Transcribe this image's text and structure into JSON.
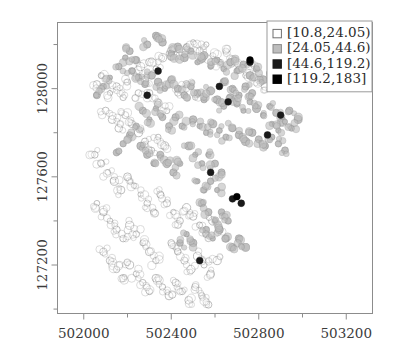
{
  "chart_data": {
    "type": "scatter",
    "title": "",
    "subtitle": "",
    "xlabel": "",
    "ylabel": "",
    "xlim": [
      501880,
      503320
    ],
    "ylim": [
      126980,
      128300
    ],
    "xticks": [
      502000,
      502400,
      502800,
      503200
    ],
    "xtick_labels": [
      "502000",
      "502400",
      "502800",
      "503200"
    ],
    "yticks": [
      127200,
      127600,
      128000
    ],
    "ytick_labels": [
      "127200",
      "127600",
      "128000"
    ],
    "minor_x_ticks": [
      502200,
      502600,
      503000
    ],
    "minor_y_ticks": [
      127000,
      127400,
      127800,
      128200
    ],
    "grid": false,
    "legend_position": "top-right",
    "legend_title": "",
    "classes": [
      {
        "label": "[10.8,24.05)",
        "fill": "#ffffff",
        "stroke": "#6f6f6f",
        "swatch": "open-square"
      },
      {
        "label": "[24.05,44.6)",
        "fill": "#bdbdbd",
        "stroke": "#8a8a8a",
        "swatch": "filled-square"
      },
      {
        "label": "[44.6,119.2)",
        "fill": "#1a1a1a",
        "stroke": "#1a1a1a",
        "swatch": "filled-square"
      },
      {
        "label": "[119.2,183]",
        "fill": "#000000",
        "stroke": "#000000",
        "swatch": "filled-square"
      }
    ],
    "series": [
      {
        "name": "[10.8,24.05)",
        "class_index": 0,
        "marker": "circle",
        "points": [
          [
            502120,
            127980
          ],
          [
            502150,
            128010
          ],
          [
            502180,
            127960
          ],
          [
            502200,
            128030
          ],
          [
            502240,
            128070
          ],
          [
            502260,
            128100
          ],
          [
            502300,
            128120
          ],
          [
            502330,
            128090
          ],
          [
            502360,
            128140
          ],
          [
            502390,
            128160
          ],
          [
            502410,
            128180
          ],
          [
            502440,
            128150
          ],
          [
            502470,
            128190
          ],
          [
            502500,
            128210
          ],
          [
            502530,
            128170
          ],
          [
            502560,
            128200
          ],
          [
            502590,
            128150
          ],
          [
            502620,
            128120
          ],
          [
            502650,
            128170
          ],
          [
            502680,
            128130
          ],
          [
            502710,
            128090
          ],
          [
            502740,
            128060
          ],
          [
            502770,
            128110
          ],
          [
            502800,
            128040
          ],
          [
            502830,
            128010
          ],
          [
            502100,
            127900
          ],
          [
            502130,
            127860
          ],
          [
            502160,
            127820
          ],
          [
            502190,
            127880
          ],
          [
            502220,
            127840
          ],
          [
            502250,
            127800
          ],
          [
            502280,
            127760
          ],
          [
            502310,
            127720
          ],
          [
            502340,
            127780
          ],
          [
            502370,
            127740
          ],
          [
            502050,
            127700
          ],
          [
            502080,
            127660
          ],
          [
            502110,
            127620
          ],
          [
            502140,
            127580
          ],
          [
            502170,
            127540
          ],
          [
            502200,
            127600
          ],
          [
            502230,
            127560
          ],
          [
            502260,
            127520
          ],
          [
            502290,
            127480
          ],
          [
            502320,
            127440
          ],
          [
            502060,
            127480
          ],
          [
            502090,
            127440
          ],
          [
            502120,
            127400
          ],
          [
            502150,
            127360
          ],
          [
            502180,
            127320
          ],
          [
            502210,
            127380
          ],
          [
            502240,
            127340
          ],
          [
            502270,
            127300
          ],
          [
            502300,
            127260
          ],
          [
            502330,
            127220
          ],
          [
            502090,
            127260
          ],
          [
            502120,
            127220
          ],
          [
            502150,
            127180
          ],
          [
            502180,
            127140
          ],
          [
            502210,
            127200
          ],
          [
            502240,
            127160
          ],
          [
            502270,
            127120
          ],
          [
            502300,
            127080
          ],
          [
            502330,
            127140
          ],
          [
            502360,
            127100
          ],
          [
            502390,
            127060
          ],
          [
            502420,
            127120
          ],
          [
            502450,
            127080
          ],
          [
            502480,
            127040
          ],
          [
            502510,
            127100
          ],
          [
            502540,
            127060
          ],
          [
            502570,
            127020
          ],
          [
            502400,
            127300
          ],
          [
            502430,
            127260
          ],
          [
            502460,
            127220
          ],
          [
            502490,
            127180
          ],
          [
            502520,
            127240
          ],
          [
            502550,
            127200
          ],
          [
            502580,
            127160
          ],
          [
            502610,
            127220
          ],
          [
            502350,
            127520
          ],
          [
            502380,
            127480
          ],
          [
            502410,
            127440
          ],
          [
            502440,
            127400
          ],
          [
            502470,
            127460
          ],
          [
            502500,
            127420
          ],
          [
            502530,
            127380
          ],
          [
            502560,
            127340
          ],
          [
            502590,
            127400
          ],
          [
            502620,
            127360
          ],
          [
            502060,
            128020
          ],
          [
            502080,
            128060
          ],
          [
            502300,
            127980
          ],
          [
            502340,
            127940
          ],
          [
            502380,
            127900
          ],
          [
            502430,
            127980
          ],
          [
            502470,
            128020
          ],
          [
            502510,
            127960
          ],
          [
            502250,
            127980
          ],
          [
            502280,
            128040
          ]
        ]
      },
      {
        "name": "[24.05,44.6)",
        "class_index": 1,
        "marker": "circle",
        "points": [
          [
            502290,
            128200
          ],
          [
            502330,
            128240
          ],
          [
            502360,
            128210
          ],
          [
            502400,
            128160
          ],
          [
            502430,
            128190
          ],
          [
            502460,
            128140
          ],
          [
            502490,
            128170
          ],
          [
            502520,
            128120
          ],
          [
            502550,
            128150
          ],
          [
            502580,
            128100
          ],
          [
            502610,
            128130
          ],
          [
            502640,
            128090
          ],
          [
            502670,
            128120
          ],
          [
            502700,
            128080
          ],
          [
            502730,
            128110
          ],
          [
            502760,
            128060
          ],
          [
            502790,
            128090
          ],
          [
            502820,
            128040
          ],
          [
            502850,
            128070
          ],
          [
            502880,
            128020
          ],
          [
            502220,
            128080
          ],
          [
            502250,
            128050
          ],
          [
            502280,
            128020
          ],
          [
            502310,
            128060
          ],
          [
            502340,
            128030
          ],
          [
            502370,
            128000
          ],
          [
            502400,
            128040
          ],
          [
            502430,
            128000
          ],
          [
            502460,
            127970
          ],
          [
            502490,
            128010
          ],
          [
            502520,
            127980
          ],
          [
            502550,
            127950
          ],
          [
            502580,
            127990
          ],
          [
            502610,
            127950
          ],
          [
            502640,
            127920
          ],
          [
            502670,
            127960
          ],
          [
            502700,
            127930
          ],
          [
            502730,
            127900
          ],
          [
            502760,
            127940
          ],
          [
            502790,
            127910
          ],
          [
            502820,
            127880
          ],
          [
            502850,
            127920
          ],
          [
            502880,
            127890
          ],
          [
            502910,
            127860
          ],
          [
            502940,
            127900
          ],
          [
            502500,
            127860
          ],
          [
            502530,
            127830
          ],
          [
            502560,
            127800
          ],
          [
            502590,
            127840
          ],
          [
            502620,
            127810
          ],
          [
            502650,
            127780
          ],
          [
            502680,
            127820
          ],
          [
            502710,
            127790
          ],
          [
            502740,
            127760
          ],
          [
            502770,
            127800
          ],
          [
            502800,
            127770
          ],
          [
            502830,
            127740
          ],
          [
            502860,
            127780
          ],
          [
            502890,
            127750
          ],
          [
            502920,
            127720
          ],
          [
            502480,
            127740
          ],
          [
            502510,
            127700
          ],
          [
            502540,
            127660
          ],
          [
            502570,
            127700
          ],
          [
            502600,
            127660
          ],
          [
            502630,
            127620
          ],
          [
            502520,
            127580
          ],
          [
            502550,
            127540
          ],
          [
            502580,
            127580
          ],
          [
            502610,
            127540
          ],
          [
            502540,
            127480
          ],
          [
            502570,
            127440
          ],
          [
            502600,
            127400
          ],
          [
            502630,
            127440
          ],
          [
            502660,
            127400
          ],
          [
            502560,
            127360
          ],
          [
            502590,
            127320
          ],
          [
            502620,
            127360
          ],
          [
            502650,
            127320
          ],
          [
            502680,
            127280
          ],
          [
            502710,
            127320
          ],
          [
            502740,
            127280
          ],
          [
            502500,
            127300
          ],
          [
            502470,
            127340
          ],
          [
            502440,
            127300
          ],
          [
            502190,
            128140
          ],
          [
            502160,
            128100
          ],
          [
            502210,
            128170
          ],
          [
            502240,
            128130
          ],
          [
            502120,
            128050
          ],
          [
            502090,
            128010
          ],
          [
            502060,
            127970
          ],
          [
            502270,
            127900
          ],
          [
            502300,
            127860
          ],
          [
            502330,
            127910
          ],
          [
            502360,
            127870
          ],
          [
            502390,
            127830
          ],
          [
            502420,
            127870
          ],
          [
            502450,
            127830
          ],
          [
            502240,
            127830
          ],
          [
            502210,
            127790
          ],
          [
            502180,
            127750
          ],
          [
            502150,
            127710
          ],
          [
            502260,
            127740
          ],
          [
            502290,
            127700
          ],
          [
            502320,
            127660
          ],
          [
            502350,
            127700
          ],
          [
            502380,
            127660
          ],
          [
            502410,
            127620
          ],
          [
            502440,
            127660
          ],
          [
            502680,
            128000
          ],
          [
            502710,
            127970
          ],
          [
            502740,
            128010
          ],
          [
            502770,
            127980
          ],
          [
            502640,
            128030
          ],
          [
            502860,
            127840
          ],
          [
            502890,
            127810
          ],
          [
            502920,
            127850
          ],
          [
            502950,
            127820
          ],
          [
            502980,
            127860
          ]
        ]
      },
      {
        "name": "[44.6,119.2)",
        "class_index": 2,
        "marker": "circle",
        "points": [
          [
            502340,
            128080
          ],
          [
            502290,
            127970
          ],
          [
            502760,
            128120
          ],
          [
            502620,
            128010
          ],
          [
            502660,
            127940
          ],
          [
            502900,
            127880
          ],
          [
            502840,
            127790
          ],
          [
            502580,
            127620
          ],
          [
            502680,
            127500
          ],
          [
            502720,
            127480
          ],
          [
            502530,
            127220
          ]
        ]
      },
      {
        "name": "[119.2,183]",
        "class_index": 3,
        "marker": "circle",
        "points": [
          [
            502700,
            127510
          ],
          [
            502760,
            128130
          ]
        ]
      }
    ]
  },
  "legend": {
    "entries": [
      {
        "label": "[10.8,24.05)"
      },
      {
        "label": "[24.05,44.6)"
      },
      {
        "label": "[44.6,119.2)"
      },
      {
        "label": "[119.2,183]"
      }
    ]
  },
  "axes": {
    "x_labels": [
      "502000",
      "502400",
      "502800",
      "503200"
    ],
    "y_labels": [
      "127200",
      "127600",
      "128000"
    ]
  }
}
